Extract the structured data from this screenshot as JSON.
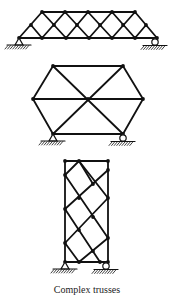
{
  "caption": "Complex trusses",
  "colors": {
    "ink": "#111111",
    "background": "#ffffff"
  },
  "trusses": [
    {
      "name": "truss-top-lattice",
      "nodes": [
        [
          19,
          38
        ],
        [
          42,
          38
        ],
        [
          66,
          38
        ],
        [
          89,
          38
        ],
        [
          112,
          38
        ],
        [
          135,
          38
        ],
        [
          157,
          38
        ],
        [
          31,
          25
        ],
        [
          54,
          25
        ],
        [
          77,
          25
        ],
        [
          100,
          25
        ],
        [
          123,
          25
        ],
        [
          146,
          25
        ],
        [
          42,
          12
        ],
        [
          65,
          12
        ],
        [
          88,
          12
        ],
        [
          112,
          12
        ],
        [
          135,
          12
        ]
      ],
      "members": [
        [
          19,
          38,
          157,
          38
        ],
        [
          42,
          12,
          135,
          12
        ],
        [
          19,
          38,
          42,
          12
        ],
        [
          157,
          38,
          135,
          12
        ],
        [
          42,
          12,
          66,
          38
        ],
        [
          65,
          12,
          89,
          38
        ],
        [
          88,
          12,
          112,
          38
        ],
        [
          112,
          12,
          135,
          38
        ],
        [
          31,
          25,
          42,
          38
        ],
        [
          42,
          38,
          65,
          12
        ],
        [
          66,
          38,
          88,
          12
        ],
        [
          89,
          38,
          112,
          12
        ],
        [
          112,
          38,
          135,
          12
        ],
        [
          135,
          38,
          146,
          25
        ]
      ],
      "supports": [
        {
          "type": "pin",
          "x": 19,
          "y": 38
        },
        {
          "type": "roller",
          "x": 155,
          "y": 38
        }
      ]
    },
    {
      "name": "truss-hexagon",
      "nodes": [
        [
          53,
          66
        ],
        [
          123,
          66
        ],
        [
          33,
          99
        ],
        [
          88,
          99
        ],
        [
          143,
          99
        ],
        [
          53,
          134
        ],
        [
          123,
          134
        ]
      ],
      "members": [
        [
          53,
          66,
          123,
          66
        ],
        [
          53,
          134,
          123,
          134
        ],
        [
          53,
          66,
          33,
          99
        ],
        [
          33,
          99,
          53,
          134
        ],
        [
          123,
          66,
          143,
          99
        ],
        [
          143,
          99,
          123,
          134
        ],
        [
          33,
          99,
          143,
          99
        ],
        [
          53,
          66,
          123,
          134
        ],
        [
          123,
          66,
          53,
          134
        ]
      ],
      "supports": [
        {
          "type": "pin",
          "x": 53,
          "y": 134
        },
        {
          "type": "roller",
          "x": 123,
          "y": 134
        }
      ]
    },
    {
      "name": "truss-tall-lattice",
      "nodes": [
        [
          65,
          161
        ],
        [
          79,
          161
        ],
        [
          108,
          161
        ],
        [
          65,
          175
        ],
        [
          108,
          170
        ],
        [
          93,
          184
        ],
        [
          79,
          198
        ],
        [
          108,
          198
        ],
        [
          65,
          209
        ],
        [
          93,
          217
        ],
        [
          79,
          230
        ],
        [
          108,
          238
        ],
        [
          65,
          243
        ],
        [
          93,
          251
        ],
        [
          65,
          262
        ],
        [
          79,
          262
        ],
        [
          100,
          262
        ],
        [
          108,
          262
        ]
      ],
      "members": [
        [
          65,
          161,
          108,
          161
        ],
        [
          65,
          262,
          108,
          262
        ],
        [
          65,
          161,
          65,
          262
        ],
        [
          108,
          161,
          108,
          262
        ],
        [
          79,
          161,
          108,
          198
        ],
        [
          65,
          175,
          108,
          238
        ],
        [
          65,
          209,
          100,
          262
        ],
        [
          65,
          243,
          79,
          262
        ],
        [
          108,
          170,
          65,
          209
        ],
        [
          108,
          198,
          65,
          243
        ],
        [
          108,
          238,
          79,
          262
        ],
        [
          93,
          184,
          79,
          161
        ],
        [
          79,
          161,
          65,
          175
        ]
      ],
      "supports": [
        {
          "type": "pin",
          "x": 65,
          "y": 262
        },
        {
          "type": "roller",
          "x": 106,
          "y": 262
        }
      ]
    }
  ]
}
